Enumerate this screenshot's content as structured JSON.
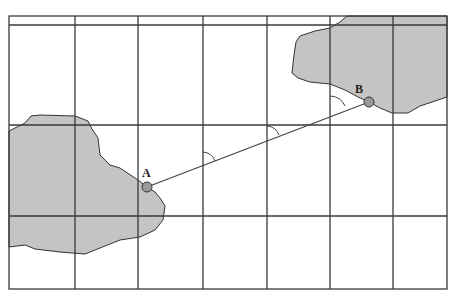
{
  "map": {
    "points": [
      {
        "label": "A",
        "x": 147,
        "y": 187
      },
      {
        "label": "B",
        "x": 369,
        "y": 102
      }
    ],
    "colors": {
      "land": "#c4c4c4",
      "grid": "#3a3a3a",
      "point": "#9a9a9a"
    },
    "grid": {
      "border": {
        "left": 9,
        "top": 16,
        "right": 447,
        "bottom": 289
      },
      "vertical_lines": [
        75,
        138,
        203,
        267,
        330,
        393
      ],
      "horizontal_lines": [
        25,
        125,
        216
      ]
    },
    "angle_markers": 3
  }
}
